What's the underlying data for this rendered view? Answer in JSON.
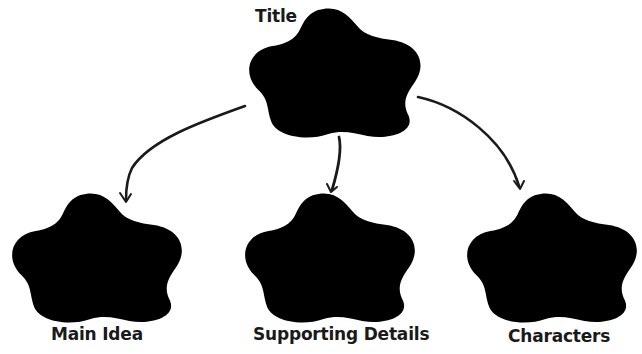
{
  "diagram": {
    "type": "graphic-organizer",
    "root": {
      "label": "Title",
      "shape": "cloud"
    },
    "children": [
      {
        "label": "Main Idea",
        "shape": "cloud"
      },
      {
        "label": "Supporting Details",
        "shape": "cloud"
      },
      {
        "label": "Characters",
        "shape": "cloud"
      }
    ],
    "edges": [
      {
        "from": "Title",
        "to": "Main Idea",
        "style": "hand-drawn-arrow"
      },
      {
        "from": "Title",
        "to": "Supporting Details",
        "style": "hand-drawn-arrow"
      },
      {
        "from": "Title",
        "to": "Characters",
        "style": "hand-drawn-arrow"
      }
    ]
  },
  "colors": {
    "background": "#ffffff",
    "cloud_outline": "#6e6e6e",
    "arrow": "#1a1a1a",
    "text": "#1a1a1a"
  }
}
